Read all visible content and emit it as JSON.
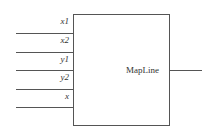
{
  "block": {
    "name": "MapLine"
  },
  "inputs": [
    {
      "label": "x1"
    },
    {
      "label": "x2"
    },
    {
      "label": "y1"
    },
    {
      "label": "y2"
    },
    {
      "label": "x"
    }
  ],
  "colors": {
    "line": "#555555",
    "text": "#333333"
  }
}
